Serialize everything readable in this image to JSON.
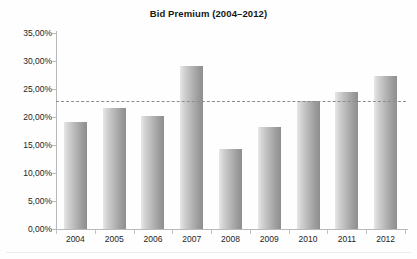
{
  "chart": {
    "title": "Bid Premium (2004–2012)"
  },
  "chart_data": {
    "type": "bar",
    "title": "Bid Premium (2004–2012)",
    "xlabel": "",
    "ylabel": "",
    "categories": [
      "2004",
      "2005",
      "2006",
      "2007",
      "2008",
      "2009",
      "2010",
      "2011",
      "2012"
    ],
    "values": [
      19.1,
      21.6,
      20.1,
      29.1,
      14.3,
      18.2,
      22.8,
      24.4,
      27.4
    ],
    "value_labels": [
      "19,10%",
      "21,60%",
      "20,10%",
      "29,10%",
      "14,30%",
      "18,20%",
      "22,80%",
      "24,40%",
      "27,40%"
    ],
    "ylim": [
      0,
      35
    ],
    "ytick_values": [
      0,
      5,
      10,
      15,
      20,
      25,
      30,
      35
    ],
    "ytick_labels": [
      "0,00%",
      "5,00%",
      "10,00%",
      "15,00%",
      "20,00%",
      "25,00%",
      "30,00%",
      "35,00%"
    ],
    "grid": false,
    "legend": "none",
    "series": [
      {
        "name": "Bid Premium",
        "values": [
          19.1,
          21.6,
          20.1,
          29.1,
          14.3,
          18.2,
          22.8,
          24.4,
          27.4
        ],
        "color": "#b2b2b2"
      }
    ],
    "reference_line": {
      "name": "average",
      "value": 22.9,
      "label": "22,90%",
      "style": "dashed",
      "color": "#8d8d8d",
      "orientation": "horizontal"
    },
    "colors": {
      "bar_light": "#e7e7e7",
      "bar_dark": "#8e8e8e",
      "axis": "#b9b9b9",
      "text": "#1d1d1d",
      "background": "#ffffff"
    }
  }
}
